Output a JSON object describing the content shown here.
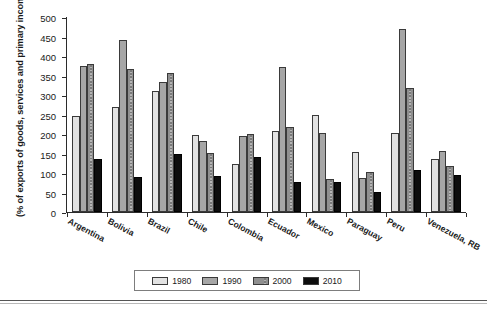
{
  "chart_data": {
    "type": "bar",
    "title": "",
    "xlabel": "",
    "ylabel": "(% of exports of goods, services and primary income)",
    "ylim": [
      0,
      500
    ],
    "yticks": [
      0,
      50,
      100,
      150,
      200,
      250,
      300,
      350,
      400,
      450,
      500
    ],
    "grid": false,
    "legend_position": "bottom",
    "categories": [
      "Argentina",
      "Bolivia",
      "Brazil",
      "Chile",
      "Colombia",
      "Ecuador",
      "Mexico",
      "Paraguay",
      "Peru",
      "Venezuela, RB"
    ],
    "series": [
      {
        "name": "1980",
        "color": "#e2e2e2",
        "values": [
          245,
          268,
          310,
          197,
          124,
          209,
          248,
          155,
          203,
          137
        ]
      },
      {
        "name": "1990",
        "color": "#a6a6a6",
        "values": [
          375,
          440,
          333,
          182,
          196,
          373,
          203,
          86,
          470,
          157
        ]
      },
      {
        "name": "2000",
        "color": "#8f8f8f",
        "values": [
          380,
          366,
          357,
          152,
          201,
          219,
          84,
          102,
          317,
          117
        ]
      },
      {
        "name": "2010",
        "color": "#0d0d0d",
        "values": [
          135,
          89,
          148,
          93,
          140,
          78,
          78,
          52,
          107,
          96
        ]
      }
    ]
  }
}
